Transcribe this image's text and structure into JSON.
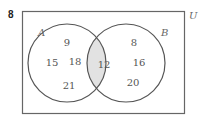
{
  "question_number": "8",
  "universal_label": "U",
  "set_a": {
    "label": "A",
    "only": [
      "9",
      "15",
      "18",
      "21"
    ]
  },
  "set_b": {
    "label": "B",
    "only": [
      "8",
      "16",
      "20"
    ]
  },
  "intersection": "12",
  "colors": {
    "stroke": "#555555",
    "intersection_fill": "#e2e2e2",
    "rect_stroke": "#666666"
  }
}
